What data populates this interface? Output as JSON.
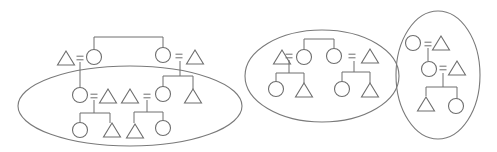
{
  "diagram": {
    "title": "",
    "legend": {
      "triangle": "male",
      "circle": "female",
      "equals": "marriage",
      "line": "descent / sibling link"
    },
    "stroke_color": "#6e6e6e",
    "groups": [
      {
        "id": "group-left",
        "members": [
          "parents' generation (2 sibling women with husbands)",
          "4 couples in middle generation",
          "4 children"
        ],
        "symbols": {
          "triangles": 7,
          "circles": 6
        }
      },
      {
        "id": "group-middle",
        "members": [
          "2 sibling women with husbands",
          "4 children"
        ],
        "symbols": {
          "triangles": 4,
          "circles": 4
        }
      },
      {
        "id": "group-right",
        "members": [
          "woman and husband",
          "daughter and husband",
          "2 children"
        ],
        "symbols": {
          "triangles": 3,
          "circles": 3
        }
      }
    ]
  }
}
